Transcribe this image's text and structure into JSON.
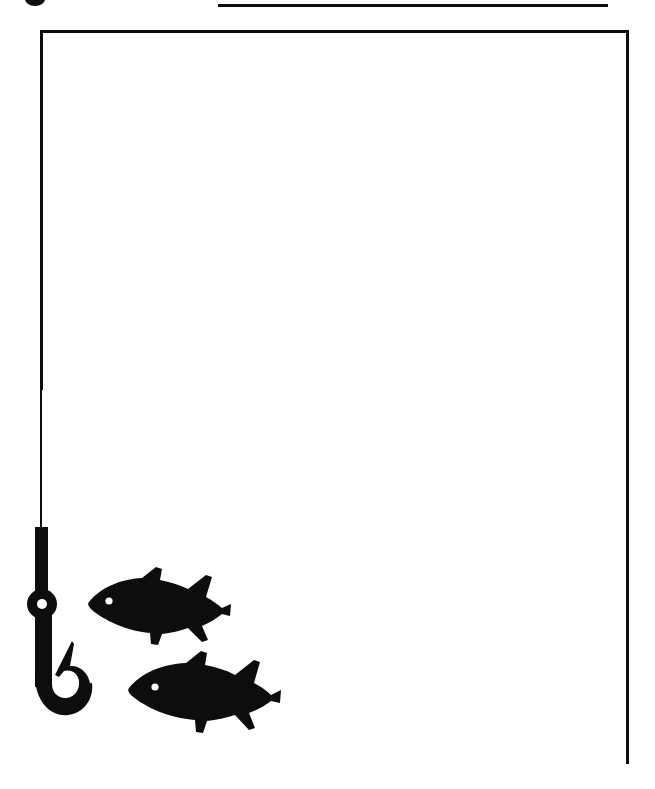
{
  "page": {
    "background_color": "#ffffff",
    "ink_color": "#0d0d0d",
    "width_px": 655,
    "height_px": 789
  },
  "rules": {
    "top_rule": {
      "name": "top horizontal rule",
      "x": 218,
      "y": 4,
      "width": 390,
      "thickness": 3
    },
    "bottom_rule": {
      "name": "bottom horizontal rule",
      "x": 170,
      "y": 761,
      "width": 459,
      "thickness": 3
    }
  },
  "frame": {
    "name": "open rectangular border",
    "top_edge": {
      "x": 40,
      "y": 30,
      "width": 589
    },
    "right_edge": {
      "x": 626,
      "y": 30,
      "height": 734
    },
    "left_edge": {
      "x": 40,
      "y": 30,
      "height": 360
    }
  },
  "artwork": {
    "glyph_remnant": {
      "name": "cropped glyph at top edge",
      "x": 25,
      "y": 0,
      "width": 20,
      "height": 6
    },
    "fishing_line": {
      "name": "fishing line",
      "x": 40,
      "y": 388,
      "height": 142,
      "thickness": 2
    },
    "hook": {
      "name": "fishing hook",
      "x": 18,
      "y": 525,
      "width": 80,
      "height": 200,
      "eye_ring_center_x": 42,
      "eye_ring_center_y": 604,
      "eye_ring_diameter": 28,
      "eye_hole_diameter": 9,
      "facing": "barb points up and left"
    },
    "fish": [
      {
        "name": "upper fish",
        "x": 86,
        "y": 566,
        "width": 148,
        "height": 82,
        "facing": "left",
        "eye_x": 109,
        "eye_y": 601,
        "eye_diameter": 7
      },
      {
        "name": "lower fish",
        "x": 126,
        "y": 650,
        "width": 160,
        "height": 86,
        "facing": "left",
        "eye_x": 155,
        "eye_y": 684,
        "eye_diameter": 7
      }
    ]
  }
}
